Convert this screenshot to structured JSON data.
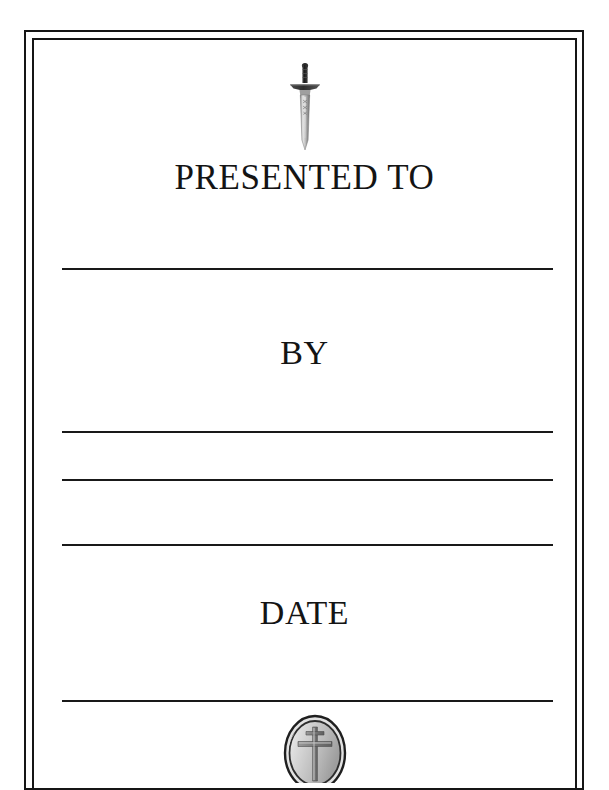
{
  "document": {
    "type": "award-certificate",
    "background_color": "#ffffff",
    "ink_color": "#151515"
  },
  "border": {
    "style": "double-rule",
    "color": "#151515"
  },
  "emblems": {
    "top": {
      "icon": "sword-icon",
      "description": "medieval sword pointing downward",
      "grip_color": "#2b2b2b",
      "blade_color": "#b8b8b8"
    },
    "bottom": {
      "icon": "cross-medallion-icon",
      "description": "oval medallion with latin cross",
      "fill_color": "#c9c9c9",
      "outline_color": "#2a2a2a"
    }
  },
  "headings": {
    "presented_to": "PRESENTED TO",
    "by": "BY",
    "date": "DATE"
  },
  "fill_lines": [
    {
      "label": "recipient-name-line",
      "value": ""
    },
    {
      "label": "presenter-line-1",
      "value": ""
    },
    {
      "label": "presenter-line-2",
      "value": ""
    },
    {
      "label": "presenter-line-3",
      "value": ""
    },
    {
      "label": "date-line",
      "value": ""
    }
  ]
}
